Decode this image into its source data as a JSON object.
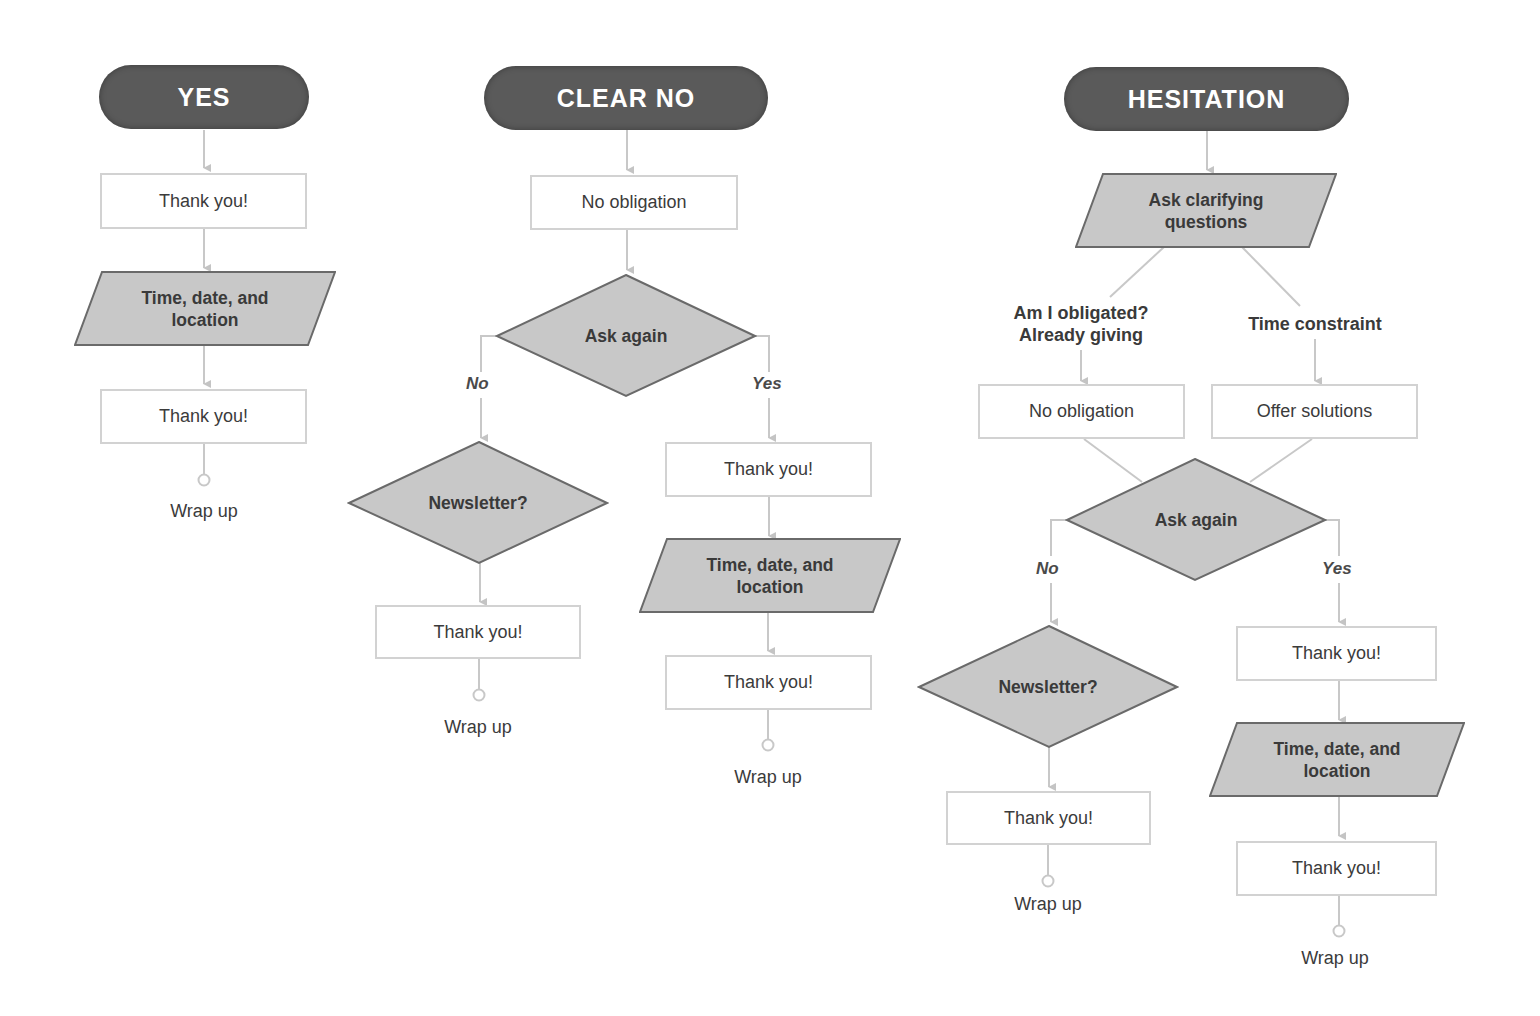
{
  "diagram": {
    "colors": {
      "terminal_fill": "#5a5a5a",
      "shape_fill": "#c8c8c8",
      "shape_stroke": "#6a6a6a",
      "connector": "#c4c4c4",
      "text": "#3b3b3b"
    },
    "columns": {
      "yes": {
        "title": "YES",
        "steps": {
          "thank_you_1": "Thank you!",
          "time_date_location": "Time, date, and\nlocation",
          "thank_you_2": "Thank you!",
          "wrap_up": "Wrap up"
        }
      },
      "clear_no": {
        "title": "CLEAR NO",
        "steps": {
          "no_obligation": "No obligation",
          "ask_again": "Ask again",
          "branch_no": "No",
          "branch_yes": "Yes",
          "newsletter": "Newsletter?",
          "no_thank_you": "Thank you!",
          "no_wrap_up": "Wrap up",
          "yes_thank_you_1": "Thank you!",
          "yes_time_date_location": "Time, date, and\nlocation",
          "yes_thank_you_2": "Thank you!",
          "yes_wrap_up": "Wrap up"
        }
      },
      "hesitation": {
        "title": "HESITATION",
        "steps": {
          "ask_clarifying": "Ask clarifying\nquestions",
          "reason_obligated": "Am I obligated?\nAlready giving",
          "reason_time": "Time constraint",
          "no_obligation": "No obligation",
          "offer_solutions": "Offer solutions",
          "ask_again": "Ask again",
          "branch_no": "No",
          "branch_yes": "Yes",
          "newsletter": "Newsletter?",
          "no_thank_you": "Thank you!",
          "no_wrap_up": "Wrap up",
          "yes_thank_you_1": "Thank you!",
          "yes_time_date_location": "Time, date, and\nlocation",
          "yes_thank_you_2": "Thank you!",
          "yes_wrap_up": "Wrap up"
        }
      }
    }
  }
}
